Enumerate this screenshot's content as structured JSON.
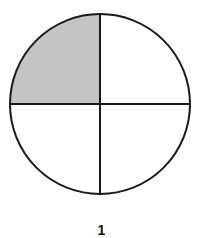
{
  "figure": {
    "label": "1",
    "circle": {
      "cx": 100,
      "cy": 104,
      "r": 90
    },
    "divisions": 4,
    "shaded_quadrant": "top-left",
    "shaded_fraction": "1/4",
    "colors": {
      "stroke": "#1a1a1a",
      "shade": "#c4c4c4",
      "background": "#ffffff"
    }
  }
}
